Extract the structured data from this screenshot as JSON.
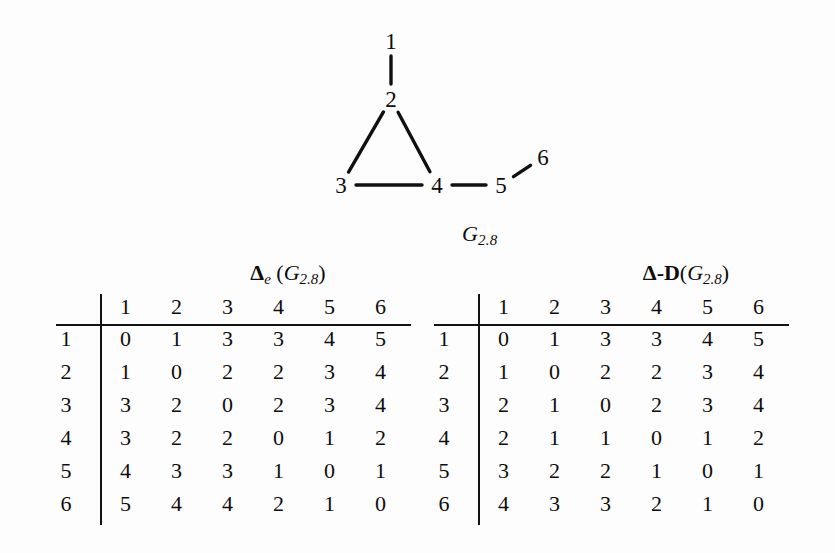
{
  "figure": {
    "caption": "G",
    "caption_sub": "2.8",
    "nodes": [
      {
        "id": "1",
        "label": "1",
        "x": 391,
        "y": 41
      },
      {
        "id": "2",
        "label": "2",
        "x": 391,
        "y": 99
      },
      {
        "id": "3",
        "label": "3",
        "x": 341,
        "y": 185
      },
      {
        "id": "4",
        "label": "4",
        "x": 437,
        "y": 185
      },
      {
        "id": "5",
        "label": "5",
        "x": 501,
        "y": 185
      },
      {
        "id": "6",
        "label": "6",
        "x": 543,
        "y": 157
      }
    ],
    "edges": [
      {
        "from": "1",
        "to": "2"
      },
      {
        "from": "2",
        "to": "3"
      },
      {
        "from": "2",
        "to": "4"
      },
      {
        "from": "3",
        "to": "4"
      },
      {
        "from": "4",
        "to": "5"
      },
      {
        "from": "5",
        "to": "6"
      }
    ],
    "edge_color": "#101010"
  },
  "matrix_left": {
    "title_delta": "Δ",
    "title_subscript": "e",
    "title_open": " (",
    "title_graph": "G",
    "title_graph_sub": "2.8",
    "title_close": ")",
    "corner": "",
    "col_headers": [
      "1",
      "2",
      "3",
      "4",
      "5",
      "6"
    ],
    "row_headers": [
      "1",
      "2",
      "3",
      "4",
      "5",
      "6"
    ],
    "rows": [
      [
        "0",
        "1",
        "3",
        "3",
        "4",
        "5"
      ],
      [
        "1",
        "0",
        "2",
        "2",
        "3",
        "4"
      ],
      [
        "3",
        "2",
        "0",
        "2",
        "3",
        "4"
      ],
      [
        "3",
        "2",
        "2",
        "0",
        "1",
        "2"
      ],
      [
        "4",
        "3",
        "3",
        "1",
        "0",
        "1"
      ],
      [
        "5",
        "4",
        "4",
        "2",
        "1",
        "0"
      ]
    ]
  },
  "matrix_right": {
    "title_delta": "Δ",
    "title_dash": "-",
    "title_D": "D",
    "title_open": "(",
    "title_graph": "G",
    "title_graph_sub": "2.8",
    "title_close": ")",
    "corner": "",
    "col_headers": [
      "1",
      "2",
      "3",
      "4",
      "5",
      "6"
    ],
    "row_headers": [
      "1",
      "2",
      "3",
      "4",
      "5",
      "6"
    ],
    "rows": [
      [
        "0",
        "1",
        "3",
        "3",
        "4",
        "5"
      ],
      [
        "1",
        "0",
        "2",
        "2",
        "3",
        "4"
      ],
      [
        "2",
        "1",
        "0",
        "2",
        "3",
        "4"
      ],
      [
        "2",
        "1",
        "1",
        "0",
        "1",
        "2"
      ],
      [
        "3",
        "2",
        "2",
        "1",
        "0",
        "1"
      ],
      [
        "4",
        "3",
        "3",
        "2",
        "1",
        "0"
      ]
    ]
  }
}
